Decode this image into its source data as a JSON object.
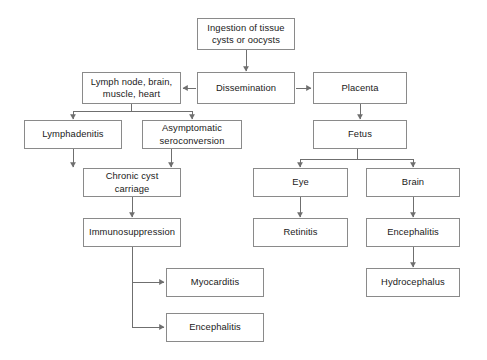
{
  "diagram": {
    "background_color": "#ffffff",
    "box_border_color": "#8a8a8a",
    "line_color": "#6f6f6f",
    "text_color": "#1a1a1a",
    "nodes": [
      {
        "id": "ingestion",
        "label": "Ingestion of tissue\ncysts or oocysts",
        "x": 197,
        "y": 18,
        "w": 98,
        "h": 32
      },
      {
        "id": "lymph-node",
        "label": "Lymph node, brain,\nmuscle, heart",
        "x": 82,
        "y": 72,
        "w": 99,
        "h": 32
      },
      {
        "id": "dissemination",
        "label": "Dissemination",
        "x": 197,
        "y": 72,
        "w": 98,
        "h": 32
      },
      {
        "id": "placenta",
        "label": "Placenta",
        "x": 313,
        "y": 72,
        "w": 94,
        "h": 32
      },
      {
        "id": "lymphadenitis",
        "label": "Lymphadenitis",
        "x": 24,
        "y": 120,
        "w": 98,
        "h": 29
      },
      {
        "id": "asymptomatic",
        "label": "Asymptomatic\nseroconversion",
        "x": 142,
        "y": 120,
        "w": 100,
        "h": 29
      },
      {
        "id": "fetus",
        "label": "Fetus",
        "x": 313,
        "y": 120,
        "w": 94,
        "h": 29
      },
      {
        "id": "chronic-cyst",
        "label": "Chronic cyst\ncarriage",
        "x": 83,
        "y": 168,
        "w": 98,
        "h": 29
      },
      {
        "id": "eye",
        "label": "Eye",
        "x": 253,
        "y": 168,
        "w": 95,
        "h": 29
      },
      {
        "id": "brain",
        "label": "Brain",
        "x": 366,
        "y": 168,
        "w": 94,
        "h": 29
      },
      {
        "id": "immunosuppression",
        "label": "Immunosuppression",
        "x": 83,
        "y": 218,
        "w": 98,
        "h": 29
      },
      {
        "id": "retinitis",
        "label": "Retinitis",
        "x": 253,
        "y": 218,
        "w": 95,
        "h": 29
      },
      {
        "id": "encephalitis-brain",
        "label": "Encephalitis",
        "x": 366,
        "y": 218,
        "w": 94,
        "h": 29
      },
      {
        "id": "myocarditis",
        "label": "Myocarditis",
        "x": 166,
        "y": 268,
        "w": 98,
        "h": 29
      },
      {
        "id": "hydrocephalus",
        "label": "Hydrocephalus",
        "x": 366,
        "y": 268,
        "w": 94,
        "h": 29
      },
      {
        "id": "encephalitis-immuno",
        "label": "Encephalitis",
        "x": 166,
        "y": 313,
        "w": 98,
        "h": 29
      }
    ],
    "edges": [
      {
        "from": "ingestion",
        "to": "dissemination",
        "kind": "vertical"
      },
      {
        "from": "dissemination",
        "to": "lymph-node",
        "kind": "horizontal-left"
      },
      {
        "from": "dissemination",
        "to": "placenta",
        "kind": "horizontal-right"
      },
      {
        "from": "lymph-node",
        "to": "lymphadenitis",
        "kind": "split-down"
      },
      {
        "from": "lymph-node",
        "to": "asymptomatic",
        "kind": "split-down"
      },
      {
        "from": "lymphadenitis",
        "to": "chronic-cyst",
        "kind": "vertical"
      },
      {
        "from": "asymptomatic",
        "to": "chronic-cyst",
        "kind": "vertical"
      },
      {
        "from": "chronic-cyst",
        "to": "immunosuppression",
        "kind": "vertical"
      },
      {
        "from": "immunosuppression",
        "to": "myocarditis",
        "kind": "elbow-right"
      },
      {
        "from": "immunosuppression",
        "to": "encephalitis-immuno",
        "kind": "elbow-right"
      },
      {
        "from": "placenta",
        "to": "fetus",
        "kind": "vertical"
      },
      {
        "from": "fetus",
        "to": "eye",
        "kind": "split-down"
      },
      {
        "from": "fetus",
        "to": "brain",
        "kind": "split-down"
      },
      {
        "from": "eye",
        "to": "retinitis",
        "kind": "vertical"
      },
      {
        "from": "brain",
        "to": "encephalitis-brain",
        "kind": "vertical"
      },
      {
        "from": "encephalitis-brain",
        "to": "hydrocephalus",
        "kind": "vertical"
      }
    ]
  }
}
